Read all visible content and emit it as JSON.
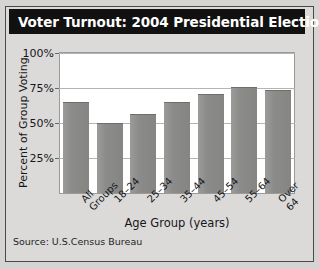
{
  "figure": {
    "title": "Voter Turnout: 2004 Presidential Election",
    "source": "Source: U.S.Census Bureau",
    "colors": {
      "title_bar_background": "#111111",
      "title_text": "#ffffff",
      "bar_fill": "#8b8b89",
      "plot_background": "#ffffff",
      "page_background": "#d6d4d2",
      "gridline": "#b4b4b2"
    }
  },
  "chart_data": {
    "type": "bar",
    "title": "Voter Turnout: 2004 Presidential Election",
    "xlabel": "Age Group (years)",
    "ylabel": "Percent of Group Voting",
    "categories": [
      "All Groups",
      "18–24",
      "25–34",
      "35–44",
      "45–54",
      "55–64",
      "Over 64"
    ],
    "values": [
      64,
      49,
      56,
      64,
      70,
      75,
      73
    ],
    "ylim": [
      0,
      100
    ],
    "yticks": [
      25,
      50,
      75,
      100
    ],
    "ytick_labels": [
      "25%",
      "50%",
      "75%",
      "100%"
    ],
    "grid": true,
    "legend": null
  }
}
